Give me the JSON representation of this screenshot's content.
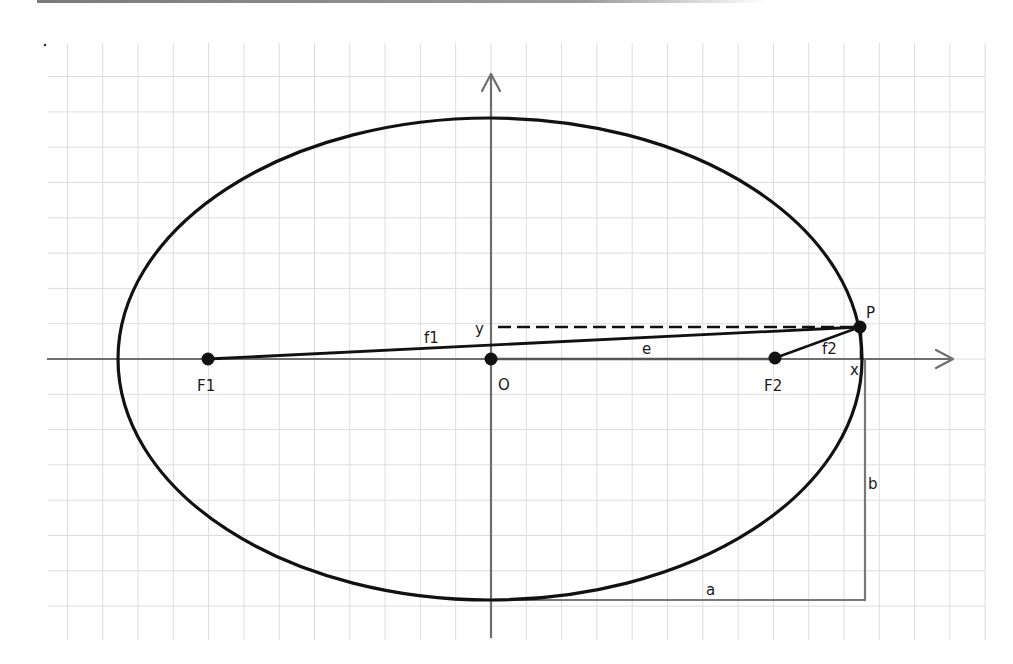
{
  "diagram": {
    "type": "ellipse-geometry",
    "colors": {
      "background": "#ffffff",
      "grid": "#dcdcdc",
      "axis": "#6e6e6e",
      "ellipse": "#111111",
      "guide": "#777777",
      "top_rule": "#8a8a8a"
    },
    "grid": {
      "x0": 48,
      "y0": 43,
      "x1": 985,
      "y1": 640,
      "spacing": 35.3
    },
    "ellipse": {
      "cx": 490,
      "cy": 359,
      "rx": 372,
      "ry": 241
    },
    "points": {
      "F1": {
        "label": "F1",
        "x": 208,
        "y": 359
      },
      "O": {
        "label": "O",
        "x": 491,
        "y": 359
      },
      "F2": {
        "label": "F2",
        "x": 775,
        "y": 358
      },
      "P": {
        "label": "P",
        "x": 860,
        "y": 327
      }
    },
    "labels": {
      "F1": "F1",
      "O": "O",
      "F2": "F2",
      "P": "P",
      "x": "x",
      "y": "y",
      "f1": "f1",
      "f2": "f2",
      "e": "e",
      "a": "a",
      "b": "b"
    }
  }
}
